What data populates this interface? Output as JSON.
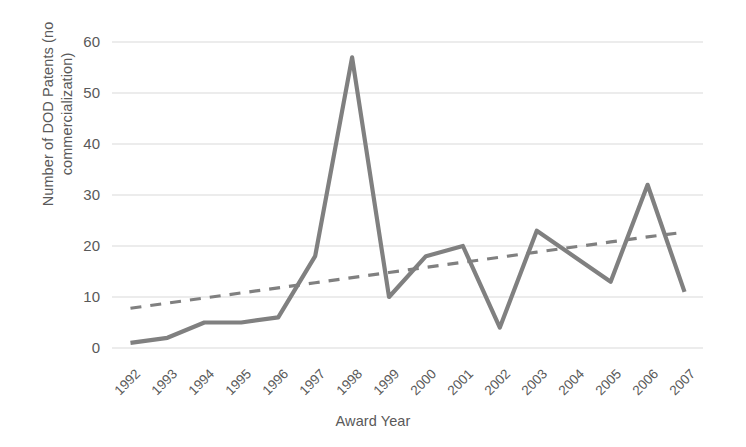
{
  "chart_data": {
    "type": "line",
    "title": "",
    "xlabel": "Award Year",
    "ylabel": "Number of DOD Patents (no\ncommercialization)",
    "ylabel_line1": "Number of DOD Patents (no",
    "ylabel_line2": "commercialization)",
    "categories": [
      "1992",
      "1993",
      "1994",
      "1995",
      "1996",
      "1997",
      "1998",
      "1999",
      "2000",
      "2001",
      "2002",
      "2003",
      "2004",
      "2005",
      "2006",
      "2007"
    ],
    "series": [
      {
        "name": "DOD Patents (no commercialization)",
        "style": "solid",
        "color": "#808080",
        "values": [
          1,
          2,
          5,
          5,
          6,
          18,
          57,
          10,
          18,
          20,
          4,
          23,
          18,
          13,
          32,
          11
        ]
      },
      {
        "name": "Linear trendline",
        "style": "dashed",
        "color": "#808080",
        "values": [
          7.8,
          8.8,
          9.8,
          10.8,
          11.8,
          12.8,
          13.8,
          14.8,
          15.8,
          16.8,
          17.8,
          18.8,
          19.8,
          20.8,
          21.8,
          22.7
        ]
      }
    ],
    "yticks": [
      0,
      10,
      20,
      30,
      40,
      50,
      60
    ],
    "ytick_labels": [
      "0",
      "10",
      "20",
      "30",
      "40",
      "50",
      "60"
    ],
    "ylim": [
      0,
      60
    ],
    "grid": "horizontal",
    "legend": "none",
    "gridline_color": "#d9d9d9",
    "text_color": "#595959",
    "background": "#ffffff"
  }
}
